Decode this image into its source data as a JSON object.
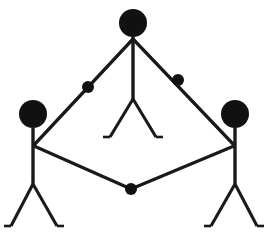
{
  "diagram": {
    "background_color": "#ffffff",
    "ink_color": "#111111",
    "stroke_color": "#1a1a1a",
    "canvas": {
      "width": 269,
      "height": 240
    },
    "figures": [
      {
        "id": "figure-top",
        "label": "top-center stick figure",
        "head": {
          "cx": 133,
          "cy": 23,
          "r": 14
        },
        "torso": {
          "x1": 133,
          "y1": 37,
          "x2": 133,
          "y2": 99
        },
        "arms": [
          {
            "name": "left-arm",
            "x1": 133,
            "y1": 39,
            "x2": 34,
            "y2": 145
          },
          {
            "name": "right-arm",
            "x1": 133,
            "y1": 39,
            "x2": 234,
            "y2": 145
          }
        ],
        "legs": [
          {
            "name": "left-leg",
            "x1": 133,
            "y1": 99,
            "x2": 110,
            "y2": 137
          },
          {
            "name": "right-leg",
            "x1": 133,
            "y1": 99,
            "x2": 156,
            "y2": 137
          }
        ],
        "feet": [
          {
            "name": "left-foot",
            "x1": 110,
            "y1": 137,
            "x2": 103,
            "y2": 137
          },
          {
            "name": "right-foot",
            "x1": 156,
            "y1": 137,
            "x2": 163,
            "y2": 137
          }
        ]
      },
      {
        "id": "figure-left",
        "label": "lower-left stick figure",
        "head": {
          "cx": 33,
          "cy": 114,
          "r": 14
        },
        "torso": {
          "x1": 33,
          "y1": 128,
          "x2": 33,
          "y2": 184
        },
        "arms": [
          {
            "name": "upper-arm",
            "x1": 34,
            "y1": 145,
            "x2": 133,
            "y2": 39
          },
          {
            "name": "lower-arm",
            "x1": 34,
            "y1": 146,
            "x2": 131,
            "y2": 189
          }
        ],
        "legs": [
          {
            "name": "left-leg",
            "x1": 33,
            "y1": 184,
            "x2": 11,
            "y2": 226
          },
          {
            "name": "right-leg",
            "x1": 33,
            "y1": 184,
            "x2": 57,
            "y2": 226
          }
        ],
        "feet": [
          {
            "name": "left-foot",
            "x1": 11,
            "y1": 226,
            "x2": 4,
            "y2": 226
          },
          {
            "name": "right-foot",
            "x1": 57,
            "y1": 226,
            "x2": 64,
            "y2": 226
          }
        ]
      },
      {
        "id": "figure-right",
        "label": "lower-right stick figure",
        "head": {
          "cx": 235,
          "cy": 114,
          "r": 14
        },
        "torso": {
          "x1": 235,
          "y1": 128,
          "x2": 235,
          "y2": 184
        },
        "arms": [
          {
            "name": "upper-arm",
            "x1": 234,
            "y1": 145,
            "x2": 133,
            "y2": 39
          },
          {
            "name": "lower-arm",
            "x1": 234,
            "y1": 146,
            "x2": 131,
            "y2": 189
          }
        ],
        "legs": [
          {
            "name": "left-leg",
            "x1": 235,
            "y1": 184,
            "x2": 211,
            "y2": 226
          },
          {
            "name": "right-leg",
            "x1": 235,
            "y1": 184,
            "x2": 257,
            "y2": 226
          }
        ],
        "feet": [
          {
            "name": "left-foot",
            "x1": 211,
            "y1": 226,
            "x2": 204,
            "y2": 226
          },
          {
            "name": "right-foot",
            "x1": 257,
            "y1": 226,
            "x2": 264,
            "y2": 226
          }
        ]
      }
    ],
    "joint_dots": [
      {
        "id": "dot-upper-left",
        "label": "joint on top-to-left link",
        "cx": 88,
        "cy": 87,
        "r": 6
      },
      {
        "id": "dot-upper-right",
        "label": "joint on top-to-right link",
        "cx": 178,
        "cy": 80,
        "r": 6
      },
      {
        "id": "dot-bottom",
        "label": "joint on left-to-right link",
        "cx": 131,
        "cy": 189,
        "r": 6
      }
    ]
  }
}
